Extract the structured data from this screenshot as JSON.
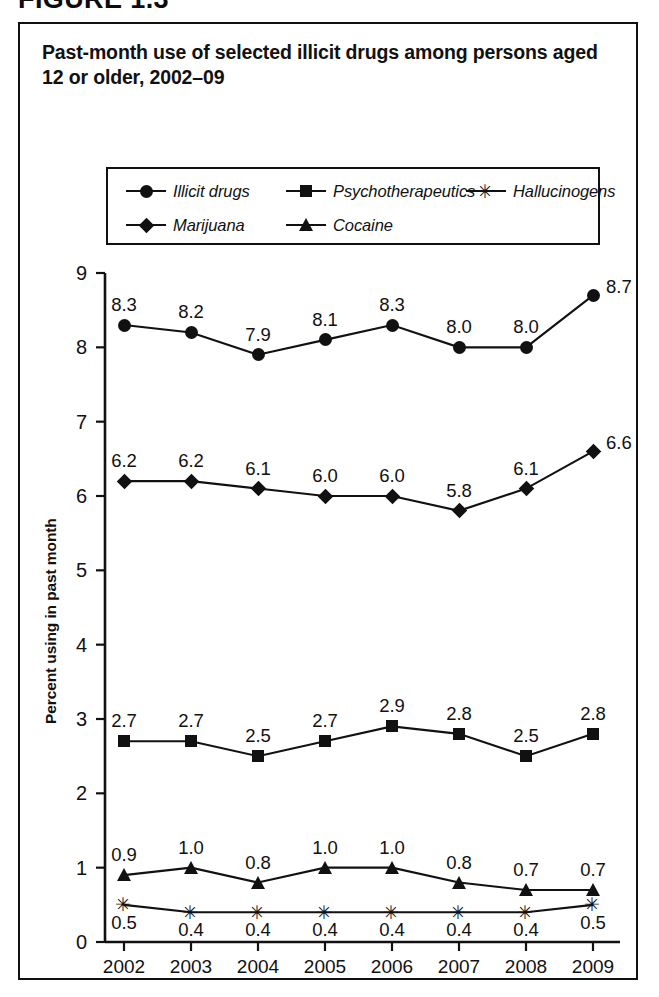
{
  "figure": {
    "caption": "FIGURE 1.3",
    "title": "Past-month use of selected illicit drugs among persons aged 12 or older, 2002–09"
  },
  "chart_data": {
    "type": "line",
    "title": "Past-month use of selected illicit drugs among persons aged 12 or older, 2002–09",
    "xlabel": "",
    "ylabel": "Percent using in past month",
    "categories": [
      "2002",
      "2003",
      "2004",
      "2005",
      "2006",
      "2007",
      "2008",
      "2009"
    ],
    "ylim": [
      0,
      9
    ],
    "yticks": [
      "0",
      "1",
      "2",
      "3",
      "4",
      "5",
      "6",
      "7",
      "8",
      "9"
    ],
    "grid": false,
    "legend_position": "top-inside",
    "series": [
      {
        "name": "Illicit drugs",
        "marker": "circle",
        "label_position": "above",
        "values": [
          8.3,
          8.2,
          7.9,
          8.1,
          8.3,
          8.0,
          8.0,
          8.7
        ],
        "labels": [
          "8.3",
          "8.2",
          "7.9",
          "8.1",
          "8.3",
          "8.0",
          "8.0",
          "8.7"
        ]
      },
      {
        "name": "Marijuana",
        "marker": "diamond",
        "label_position": "above",
        "values": [
          6.2,
          6.2,
          6.1,
          6.0,
          6.0,
          5.8,
          6.1,
          6.6
        ],
        "labels": [
          "6.2",
          "6.2",
          "6.1",
          "6.0",
          "6.0",
          "5.8",
          "6.1",
          "6.6"
        ]
      },
      {
        "name": "Psychotherapeutics",
        "marker": "square",
        "label_position": "above",
        "values": [
          2.7,
          2.7,
          2.5,
          2.7,
          2.9,
          2.8,
          2.5,
          2.8
        ],
        "labels": [
          "2.7",
          "2.7",
          "2.5",
          "2.7",
          "2.9",
          "2.8",
          "2.5",
          "2.8"
        ]
      },
      {
        "name": "Cocaine",
        "marker": "triangle",
        "label_position": "above",
        "values": [
          0.9,
          1.0,
          0.8,
          1.0,
          1.0,
          0.8,
          0.7,
          0.7
        ],
        "labels": [
          "0.9",
          "1.0",
          "0.8",
          "1.0",
          "1.0",
          "0.8",
          "0.7",
          "0.7"
        ]
      },
      {
        "name": "Hallucinogens",
        "marker": "asterisk",
        "label_position": "below",
        "values": [
          0.5,
          0.4,
          0.4,
          0.4,
          0.4,
          0.4,
          0.4,
          0.5
        ],
        "labels": [
          "0.5",
          "0.4",
          "0.4",
          "0.4",
          "0.4",
          "0.4",
          "0.4",
          "0.5"
        ]
      }
    ]
  },
  "legend": {
    "rows": [
      [
        {
          "label": "Illicit drugs",
          "marker": "circle"
        },
        {
          "label": "Psychotherapeutics",
          "marker": "square"
        },
        {
          "label": "Hallucinogens",
          "marker": "asterisk"
        }
      ],
      [
        {
          "label": "Marijuana",
          "marker": "diamond"
        },
        {
          "label": "Cocaine",
          "marker": "triangle"
        }
      ]
    ]
  },
  "colors": {
    "ink": "#111111",
    "background": "#ffffff"
  }
}
